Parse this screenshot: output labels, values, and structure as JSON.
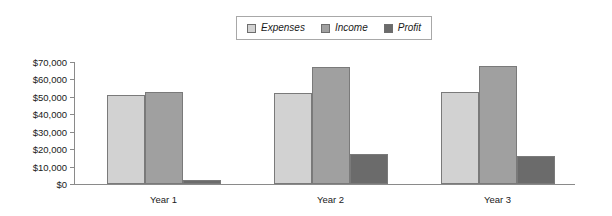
{
  "chart_data": {
    "type": "bar",
    "title": "",
    "subtitle": "",
    "xlabel": "",
    "ylabel": "",
    "categories": [
      "Year 1",
      "Year 2",
      "Year 3"
    ],
    "series": [
      {
        "name": "Expenses",
        "color": "#d2d2d2",
        "values": [
          51000,
          52000,
          53000
        ]
      },
      {
        "name": "Income",
        "color": "#a0a0a0",
        "values": [
          53000,
          67000,
          68000
        ]
      },
      {
        "name": "Profit",
        "color": "#6b6b6b",
        "values": [
          2500,
          17000,
          16000
        ]
      }
    ],
    "ylim": [
      0,
      70000
    ],
    "ytick_values": [
      70000,
      60000,
      50000,
      40000,
      30000,
      20000,
      10000,
      0
    ],
    "ytick_labels": [
      "$70,000",
      "$60,000",
      "$50,000",
      "$40,000",
      "$30,000",
      "$20,000",
      "$10,000",
      "$0"
    ],
    "grid": false,
    "legend_position": "top-center",
    "axis_color": "#8a8a8a",
    "bar_border_color": "#7a7a7a",
    "background": "#ffffff"
  }
}
